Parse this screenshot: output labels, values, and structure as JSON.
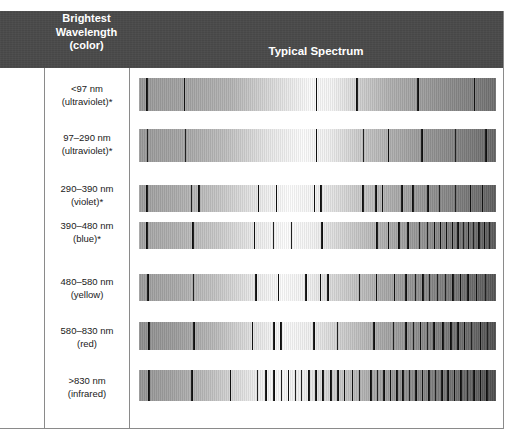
{
  "figure": {
    "type": "spectral-comparison-table",
    "background": "#ffffff",
    "header_background": "#4a4a4a",
    "header_text_color": "#ffffff",
    "rule_color": "#8a8a8a",
    "absorption_line_color": "#111111"
  },
  "header": {
    "col1_line1": "Brightest",
    "col1_line2": "Wavelength",
    "col1_line3": "(color)",
    "col2": "Typical Spectrum"
  },
  "rows": [
    {
      "label_line1": "<97 nm",
      "label_line2": "(ultraviolet)*",
      "top": 78,
      "height": 33,
      "label_top": 83,
      "gradient": "linear-gradient(90deg, #9a9a9a 0%, #a2a2a2 12%, #b4b4b4 26%, #dcdcdc 38%, #fbfbfb 48%, #f4f4f4 54%, #cfcfcf 62%, #b0b0b0 70%, #a0a0a0 78%, #8e8e8e 86%, #7e7e7e 94%, #6e6e6e 100%)",
      "lines": [
        {
          "x": 2.0,
          "w": 1.6
        },
        {
          "x": 12.5,
          "w": 1.7
        },
        {
          "x": 49.5,
          "w": 1.4
        },
        {
          "x": 60.8,
          "w": 1.8
        },
        {
          "x": 78.0,
          "w": 1.5
        },
        {
          "x": 93.8,
          "w": 1.4
        }
      ]
    },
    {
      "label_line1": "97–290 nm",
      "label_line2": "(ultraviolet)*",
      "top": 129,
      "height": 33,
      "label_top": 132,
      "gradient": "linear-gradient(90deg, #9a9a9a 0%, #a5a5a5 12%, #bdbdbd 24%, #e6e6e6 36%, #fcfcfc 46%, #f0f0f0 53%, #c8c8c8 62%, #b0b0b0 70%, #9c9c9c 78%, #8a8a8a 86%, #787878 94%, #666666 100%)",
      "lines": [
        {
          "x": 2.2,
          "w": 1.6
        },
        {
          "x": 12.8,
          "w": 1.6
        },
        {
          "x": 49.5,
          "w": 1.5
        },
        {
          "x": 62.8,
          "w": 1.3
        },
        {
          "x": 69.8,
          "w": 1.3
        },
        {
          "x": 79.0,
          "w": 1.5
        },
        {
          "x": 88.5,
          "w": 1.5
        },
        {
          "x": 97.0,
          "w": 1.4
        }
      ]
    },
    {
      "label_line1": "290–390 nm",
      "label_line2": "(violet)*",
      "top": 185,
      "height": 27,
      "label_top": 183,
      "gradient": "linear-gradient(90deg, #9f9f9f 0%, #ababab 10%, #c4c4c4 22%, #e8e8e8 33%, #fdfdfd 42%, #f2f2f2 50%, #cdcdcd 60%, #b2b2b2 69%, #9a9a9a 78%, #858585 87%, #707070 95%, #5e5e5e 100%)",
      "lines": [
        {
          "x": 2.0,
          "w": 1.9
        },
        {
          "x": 14.5,
          "w": 1.3
        },
        {
          "x": 16.6,
          "w": 1.5
        },
        {
          "x": 33.4,
          "w": 1.2
        },
        {
          "x": 38.4,
          "w": 1.3
        },
        {
          "x": 49.0,
          "w": 1.3
        },
        {
          "x": 50.8,
          "w": 1.3
        },
        {
          "x": 62.6,
          "w": 1.3
        },
        {
          "x": 66.2,
          "w": 1.2
        },
        {
          "x": 68.0,
          "w": 1.5
        },
        {
          "x": 73.5,
          "w": 1.2
        },
        {
          "x": 76.5,
          "w": 1.6
        },
        {
          "x": 80.8,
          "w": 1.4
        },
        {
          "x": 84.0,
          "w": 1.2
        },
        {
          "x": 88.4,
          "w": 1.5
        },
        {
          "x": 92.6,
          "w": 1.3
        },
        {
          "x": 96.0,
          "w": 1.3
        }
      ]
    },
    {
      "label_line1": "390–480 nm",
      "label_line2": "(blue)*",
      "top": 222,
      "height": 27,
      "label_top": 220,
      "gradient": "linear-gradient(90deg, #a4a4a4 0%, #b0b0b0 10%, #c9c9c9 22%, #ececec 33%, #fdfdfd 41%, #f2f2f2 49%, #d0d0d0 58%, #b4b4b4 67%, #9c9c9c 76%, #868686 85%, #6f6f6f 94%, #5a5a5a 100%)",
      "lines": [
        {
          "x": 2.0,
          "w": 1.8
        },
        {
          "x": 14.8,
          "w": 1.7
        },
        {
          "x": 32.2,
          "w": 1.3
        },
        {
          "x": 37.6,
          "w": 1.2
        },
        {
          "x": 42.6,
          "w": 1.2
        },
        {
          "x": 51.0,
          "w": 1.6
        },
        {
          "x": 66.5,
          "w": 1.4
        },
        {
          "x": 69.8,
          "w": 1.3
        },
        {
          "x": 72.6,
          "w": 1.5
        },
        {
          "x": 75.2,
          "w": 1.2
        },
        {
          "x": 78.4,
          "w": 1.4
        },
        {
          "x": 80.6,
          "w": 1.2
        },
        {
          "x": 82.5,
          "w": 1.5
        },
        {
          "x": 84.4,
          "w": 1.2
        },
        {
          "x": 86.0,
          "w": 1.3
        },
        {
          "x": 87.6,
          "w": 1.2
        },
        {
          "x": 89.2,
          "w": 1.4
        },
        {
          "x": 90.8,
          "w": 1.2
        },
        {
          "x": 92.2,
          "w": 1.3
        },
        {
          "x": 93.6,
          "w": 1.2
        },
        {
          "x": 95.0,
          "w": 1.4
        },
        {
          "x": 96.5,
          "w": 1.2
        },
        {
          "x": 98.0,
          "w": 1.3
        }
      ]
    },
    {
      "label_line1": "480–580 nm",
      "label_line2": "(yellow)",
      "top": 274,
      "height": 27,
      "label_top": 276,
      "gradient": "linear-gradient(90deg, #9d9d9d 0%, #a9a9a9 10%, #c2c2c2 21%, #e9e9e9 32%, #fcfcfc 40%, #efefef 48%, #cbcbcb 58%, #aeaeae 67%, #969696 76%, #808080 85%, #6a6a6a 94%, #555555 100%)",
      "lines": [
        {
          "x": 2.2,
          "w": 1.8
        },
        {
          "x": 15.0,
          "w": 1.7
        },
        {
          "x": 32.6,
          "w": 1.3
        },
        {
          "x": 38.8,
          "w": 1.5
        },
        {
          "x": 46.6,
          "w": 1.3
        },
        {
          "x": 50.6,
          "w": 1.3
        },
        {
          "x": 52.8,
          "w": 1.5
        },
        {
          "x": 61.6,
          "w": 1.5
        },
        {
          "x": 66.4,
          "w": 1.4
        },
        {
          "x": 71.4,
          "w": 1.3
        },
        {
          "x": 74.6,
          "w": 1.4
        },
        {
          "x": 77.2,
          "w": 1.5
        },
        {
          "x": 79.4,
          "w": 1.2
        },
        {
          "x": 81.2,
          "w": 1.4
        },
        {
          "x": 83.4,
          "w": 1.2
        },
        {
          "x": 85.6,
          "w": 1.5
        },
        {
          "x": 87.8,
          "w": 1.2
        },
        {
          "x": 89.8,
          "w": 1.3
        },
        {
          "x": 92.0,
          "w": 1.4
        },
        {
          "x": 94.4,
          "w": 1.3
        },
        {
          "x": 96.8,
          "w": 1.4
        }
      ]
    },
    {
      "label_line1": "580–830 nm",
      "label_line2": "(red)",
      "top": 322,
      "height": 28,
      "label_top": 325,
      "gradient": "linear-gradient(90deg, #8f8f8f 0%, #9c9c9c 10%, #b8b8b8 21%, #e2e2e2 32%, #fbfbfb 40%, #efefef 48%, #cacaca 58%, #ababab 67%, #939393 76%, #7d7d7d 85%, #666666 94%, #505050 100%)",
      "lines": [
        {
          "x": 2.5,
          "w": 1.8
        },
        {
          "x": 15.2,
          "w": 1.7
        },
        {
          "x": 31.6,
          "w": 1.7
        },
        {
          "x": 37.6,
          "w": 1.4
        },
        {
          "x": 39.6,
          "w": 1.3
        },
        {
          "x": 48.8,
          "w": 1.5
        },
        {
          "x": 55.4,
          "w": 1.4
        },
        {
          "x": 65.6,
          "w": 1.6
        },
        {
          "x": 71.2,
          "w": 1.3
        },
        {
          "x": 74.6,
          "w": 1.4
        },
        {
          "x": 76.8,
          "w": 1.3
        },
        {
          "x": 78.6,
          "w": 1.5
        },
        {
          "x": 80.6,
          "w": 1.3
        },
        {
          "x": 82.4,
          "w": 1.4
        },
        {
          "x": 85.0,
          "w": 1.3
        },
        {
          "x": 87.2,
          "w": 1.5
        },
        {
          "x": 89.2,
          "w": 1.3
        },
        {
          "x": 91.0,
          "w": 1.6
        },
        {
          "x": 93.0,
          "w": 1.4
        },
        {
          "x": 95.4,
          "w": 1.3
        },
        {
          "x": 97.4,
          "w": 1.5
        }
      ]
    },
    {
      "label_line1": ">830 nm",
      "label_line2": "(infrared)",
      "top": 370,
      "height": 31,
      "label_top": 375,
      "gradient": "linear-gradient(90deg, #959595 0%, #a2a2a2 9%, #bcbcbc 19%, #e4e4e4 30%, #fafafa 38%, #eeeeee 46%, #c6c6c6 57%, #a8a8a8 66%, #909090 75%, #7a7a7a 85%, #636363 94%, #4e4e4e 100%)",
      "lines": [
        {
          "x": 2.5,
          "w": 1.8
        },
        {
          "x": 14.6,
          "w": 1.8
        },
        {
          "x": 25.4,
          "w": 1.5
        },
        {
          "x": 33.0,
          "w": 1.5
        },
        {
          "x": 35.4,
          "w": 1.3
        },
        {
          "x": 37.6,
          "w": 1.4
        },
        {
          "x": 39.8,
          "w": 1.2
        },
        {
          "x": 41.6,
          "w": 1.5
        },
        {
          "x": 43.6,
          "w": 1.3
        },
        {
          "x": 45.4,
          "w": 1.4
        },
        {
          "x": 47.4,
          "w": 1.3
        },
        {
          "x": 49.4,
          "w": 1.5
        },
        {
          "x": 51.4,
          "w": 1.3
        },
        {
          "x": 53.6,
          "w": 1.4
        },
        {
          "x": 55.6,
          "w": 1.3
        },
        {
          "x": 57.4,
          "w": 1.5
        },
        {
          "x": 59.6,
          "w": 1.3
        },
        {
          "x": 61.6,
          "w": 1.4
        },
        {
          "x": 64.8,
          "w": 1.5
        },
        {
          "x": 66.6,
          "w": 1.3
        },
        {
          "x": 68.4,
          "w": 1.4
        },
        {
          "x": 70.2,
          "w": 1.3
        },
        {
          "x": 72.0,
          "w": 1.5
        },
        {
          "x": 73.8,
          "w": 1.3
        },
        {
          "x": 75.6,
          "w": 1.4
        },
        {
          "x": 77.4,
          "w": 1.3
        },
        {
          "x": 79.2,
          "w": 1.5
        },
        {
          "x": 81.0,
          "w": 1.4
        },
        {
          "x": 82.8,
          "w": 1.3
        },
        {
          "x": 84.6,
          "w": 1.5
        },
        {
          "x": 86.4,
          "w": 1.3
        },
        {
          "x": 88.2,
          "w": 1.4
        },
        {
          "x": 90.0,
          "w": 1.5
        },
        {
          "x": 91.8,
          "w": 1.3
        },
        {
          "x": 93.6,
          "w": 1.5
        },
        {
          "x": 95.4,
          "w": 1.4
        },
        {
          "x": 97.2,
          "w": 1.5
        }
      ]
    }
  ]
}
